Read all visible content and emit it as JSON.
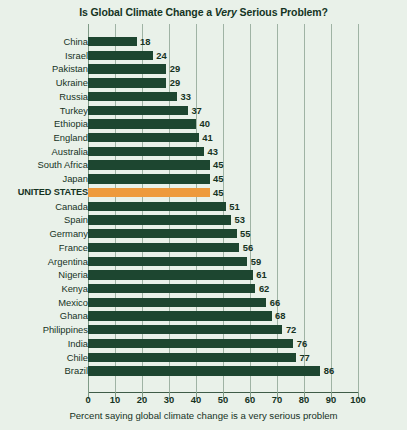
{
  "chart_data": {
    "type": "bar",
    "orientation": "horizontal",
    "title": "Is Global Climate Change a Very Serious Problem?",
    "title_parts": {
      "before": "Is Global Climate Change a ",
      "emphasis": "Very",
      "after": " Serious Problem?"
    },
    "xlabel": "Percent saying global climate change is a very serious problem",
    "ylabel": "",
    "xlim": [
      0,
      100
    ],
    "xticks": [
      "0",
      "10",
      "20",
      "30",
      "40",
      "50",
      "60",
      "70",
      "80",
      "90",
      "100"
    ],
    "grid": true,
    "legend": false,
    "categories": [
      "China",
      "Israel",
      "Pakistan",
      "Ukraine",
      "Russia",
      "Turkey",
      "Ethiopia",
      "England",
      "Australia",
      "South Africa",
      "Japan",
      "UNITED STATES",
      "Canada",
      "Spain",
      "Germany",
      "France",
      "Argentina",
      "Nigeria",
      "Kenya",
      "Mexico",
      "Ghana",
      "Philippines",
      "India",
      "Chile",
      "Brazil"
    ],
    "values": [
      18,
      24,
      29,
      29,
      33,
      37,
      40,
      41,
      43,
      45,
      45,
      45,
      51,
      53,
      55,
      56,
      59,
      61,
      62,
      66,
      68,
      72,
      76,
      77,
      86
    ],
    "highlight_category": "UNITED STATES",
    "colors": {
      "bar": "#1d4630",
      "highlight_bar": "#ee9a3c",
      "background": "#e9f1e9",
      "text": "#16331f",
      "gridline": "#9fb3a4"
    }
  }
}
